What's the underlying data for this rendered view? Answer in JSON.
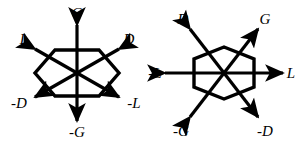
{
  "figure": {
    "background_color": "#ffffff",
    "stroke_color": "#000000",
    "label_color": "#000000",
    "panel_count": 2
  },
  "panels": [
    {
      "id": "left",
      "name": "flat-top-hexagon-diagram",
      "hexagon_orientation": "flat-top",
      "center": {
        "x": 77,
        "y": 73
      },
      "labels": {
        "top": "G",
        "upper_left": "L",
        "upper_right": "D",
        "lower_left": "-D",
        "lower_right": "-L",
        "bottom": "-G"
      },
      "axes": [
        {
          "name": "vertical-axis",
          "positive": "G",
          "negative": "-G",
          "angle_deg": 90
        },
        {
          "name": "upper-left-axis",
          "positive": "L",
          "negative": "-L",
          "angle_deg": 150
        },
        {
          "name": "upper-right-axis",
          "positive": "D",
          "negative": "-D",
          "angle_deg": 30
        }
      ]
    },
    {
      "id": "right",
      "name": "pointy-top-hexagon-diagram",
      "hexagon_orientation": "pointy-top",
      "center": {
        "x": 77,
        "y": 73
      },
      "labels": {
        "upper_left": "D",
        "upper_right": "G",
        "left": "-L",
        "right": "L",
        "lower_left": "-G",
        "lower_right": "-D"
      },
      "axes": [
        {
          "name": "horizontal-axis",
          "positive": "L",
          "negative": "-L",
          "angle_deg": 0
        },
        {
          "name": "upper-right-axis",
          "positive": "G",
          "negative": "-G",
          "angle_deg": 60
        },
        {
          "name": "upper-left-axis",
          "positive": "D",
          "negative": "-D",
          "angle_deg": 120
        }
      ]
    }
  ]
}
